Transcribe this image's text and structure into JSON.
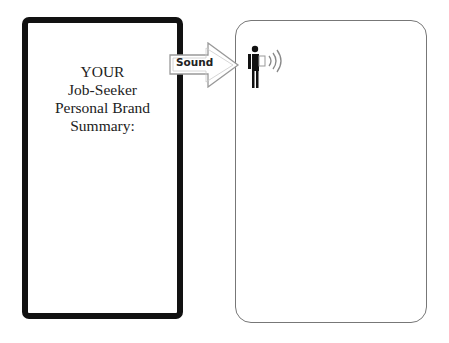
{
  "left_panel": {
    "title_lines": [
      "YOUR",
      "Job-Seeker",
      "Personal Brand",
      "Summary:"
    ]
  },
  "arrow": {
    "label": "Sound"
  },
  "right_panel": {
    "icon": "person-emitting-sound-icon"
  },
  "colors": {
    "left_border": "#111111",
    "right_border": "#777777",
    "arrow_stroke": "#999999",
    "text": "#222222"
  }
}
